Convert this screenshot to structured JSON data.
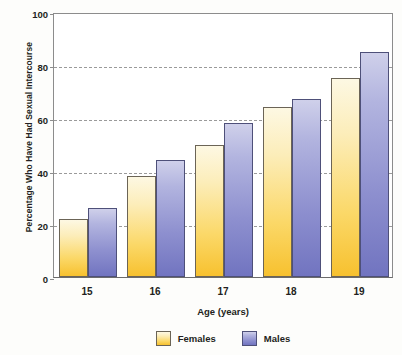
{
  "chart_data": {
    "type": "bar",
    "title": "",
    "xlabel": "Age (years)",
    "ylabel": "Percentage Who Have Had Sexual Intercourse",
    "categories": [
      "15",
      "16",
      "17",
      "18",
      "19"
    ],
    "series": [
      {
        "name": "Females",
        "color": "#fbd868",
        "values": [
          22,
          38,
          50,
          64,
          75
        ]
      },
      {
        "name": "Males",
        "color": "#8e90cf",
        "values": [
          26,
          44,
          58,
          67,
          85
        ]
      }
    ],
    "ylim": [
      0,
      100
    ],
    "yticks": [
      0,
      20,
      40,
      60,
      80,
      100
    ],
    "ytick_labels": [
      "0",
      "20",
      "40",
      "60",
      "80",
      "100"
    ],
    "grid": true,
    "grid_style": "dashed-horizontal",
    "legend_position": "bottom-center",
    "legend": [
      "Females",
      "Males"
    ]
  }
}
